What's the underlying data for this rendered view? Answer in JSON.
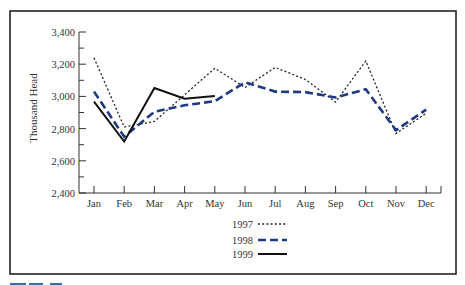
{
  "chart_data": {
    "type": "line",
    "title": "",
    "xlabel": "",
    "ylabel": "Thousand Head",
    "ylim": [
      2400,
      3400
    ],
    "yticks": [
      "2,400",
      "2,600",
      "2,800",
      "3,000",
      "3,200",
      "3,400"
    ],
    "ytick_values": [
      2400,
      2600,
      2800,
      3000,
      3200,
      3400
    ],
    "categories": [
      "Jan",
      "Feb",
      "Mar",
      "Apr",
      "May",
      "Jun",
      "Jul",
      "Aug",
      "Sep",
      "Oct",
      "Nov",
      "Dec"
    ],
    "grid": false,
    "legend_position": "bottom-center",
    "series": [
      {
        "name": "1997",
        "style": "dotted",
        "color": "#222222",
        "values": [
          3240,
          2810,
          2845,
          3010,
          3175,
          3055,
          3180,
          3105,
          2965,
          3220,
          2770,
          2895
        ]
      },
      {
        "name": "1998",
        "style": "dashed",
        "color": "#1e3a80",
        "values": [
          3030,
          2750,
          2905,
          2945,
          2970,
          3088,
          3030,
          3027,
          2993,
          3045,
          2790,
          2918
        ]
      },
      {
        "name": "1999",
        "style": "solid",
        "color": "#111111",
        "values": [
          2968,
          2720,
          3052,
          2985,
          3002,
          null,
          null,
          null,
          null,
          null,
          null,
          null
        ]
      }
    ]
  },
  "legend": {
    "items": [
      {
        "label": "1997"
      },
      {
        "label": "1998"
      },
      {
        "label": "1999"
      }
    ]
  }
}
